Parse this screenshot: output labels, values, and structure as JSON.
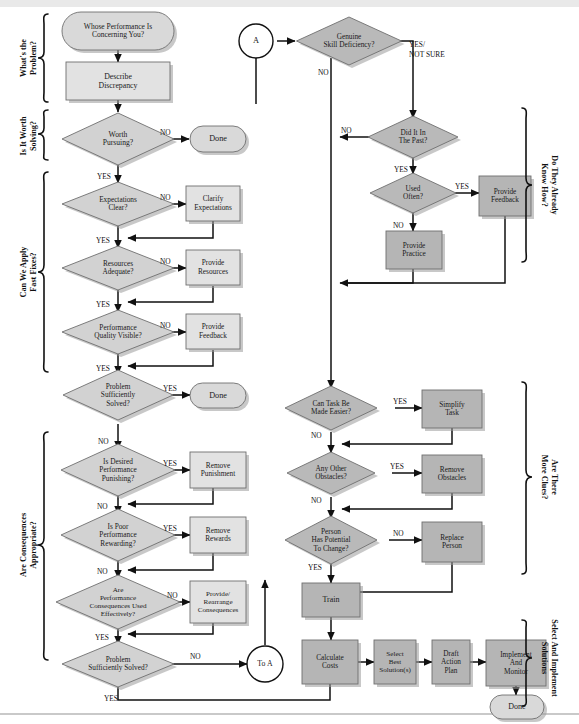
{
  "diagram": {
    "colors": {
      "light_box": "#e2e2e2",
      "dark_box": "#b5b5b5",
      "diamond": "#d2d2d2",
      "diamond_dark": "#b9b9b9",
      "terminator": "#d9d9d9",
      "line": "#111111",
      "text": "#1a1a1a"
    },
    "group_labels": {
      "left": [
        "What's the Problem?",
        "Is It Worth Solving?",
        "Can We Apply Fast Fixes?",
        "Are Consequences Appropriate?"
      ],
      "right": [
        "Do They Already Know How?",
        "Are There More Clues?",
        "Select And Implement Solutions"
      ]
    },
    "edge_labels": {
      "yes": "YES",
      "no": "NO",
      "yes_not_sure": "YES/ NOT SURE"
    },
    "nodes": {
      "whose_performance": "Whose Performance Is Concerning You?",
      "describe_discrepancy": "Describe Discrepancy",
      "worth_pursuing": "Worth Pursuing?",
      "done_1": "Done",
      "expectations_clear": "Expectations Clear?",
      "clarify_expectations": "Clarify Expectations",
      "resources_adequate": "Resources Adequate?",
      "provide_resources": "Provide Resources",
      "performance_quality_visible": "Performance Quality Visible?",
      "provide_feedback_left": "Provide Feedback",
      "problem_solved_1": "Problem Sufficiently Solved?",
      "done_2": "Done",
      "is_desired_performance_punishing": "Is Desired Performance Punishing?",
      "remove_punishment": "Remove Punishment",
      "is_poor_performance_rewarding": "Is Poor Performance Rewarding?",
      "remove_rewards": "Remove Rewards",
      "are_performance_consequences": "Are Performance Consequences Used Effectively?",
      "provide_rearrange_consequences": "Provide/ Rearrange Consequences",
      "problem_solved_2": "Problem Sufficiently Solved?",
      "to_a": "To A",
      "connector_a": "A",
      "genuine_skill_deficiency": "Genuine Skill Deficiency?",
      "did_it_in_the_past": "Did It In The Past?",
      "used_often": "Used Often?",
      "provide_feedback_right": "Provide Feedback",
      "provide_practice": "Provide Practice",
      "can_task_be_made_easier": "Can Task Be Made Easier?",
      "simplify_task": "Simplify Task",
      "any_other_obstacles": "Any Other Obstacles?",
      "remove_obstacles": "Remove Obstacles",
      "person_has_potential": "Person Has Potential To Change?",
      "replace_person": "Replace Person",
      "train": "Train",
      "calculate_costs": "Calculate Costs",
      "select_best_solutions": "Select Best Solution(s)",
      "draft_action_plan": "Draft Action Plan",
      "implement_and_monitor": "Implement And Monitor",
      "done_3": "Done"
    },
    "node_lines": {
      "whose_performance": [
        "Whose Performance Is",
        "Concerning You?"
      ],
      "describe_discrepancy": [
        "Describe",
        "Discrepancy"
      ],
      "worth_pursuing": [
        "Worth",
        "Pursuing?"
      ],
      "done_1": [
        "Done"
      ],
      "expectations_clear": [
        "Expectations",
        "Clear?"
      ],
      "clarify_expectations": [
        "Clarify",
        "Expectations"
      ],
      "resources_adequate": [
        "Resources",
        "Adequate?"
      ],
      "provide_resources": [
        "Provide",
        "Resources"
      ],
      "performance_quality_visible": [
        "Performance",
        "Quality Visible?"
      ],
      "provide_feedback_left": [
        "Provide",
        "Feedback"
      ],
      "problem_solved_1": [
        "Problem",
        "Sufficiently",
        "Solved?"
      ],
      "done_2": [
        "Done"
      ],
      "is_desired_performance_punishing": [
        "Is Desired",
        "Performance",
        "Punishing?"
      ],
      "remove_punishment": [
        "Remove",
        "Punishment"
      ],
      "is_poor_performance_rewarding": [
        "Is Poor",
        "Performance",
        "Rewarding?"
      ],
      "remove_rewards": [
        "Remove",
        "Rewards"
      ],
      "are_performance_consequences": [
        "Are",
        "Performance",
        "Consequences Used",
        "Effectively?"
      ],
      "provide_rearrange_consequences": [
        "Provide/",
        "Rearrange",
        "Consequences"
      ],
      "problem_solved_2": [
        "Problem",
        "Sufficiently Solved?"
      ],
      "to_a": [
        "To A"
      ],
      "connector_a": [
        "A"
      ],
      "genuine_skill_deficiency": [
        "Genuine",
        "Skill Deficiency?"
      ],
      "did_it_in_the_past": [
        "Did It In",
        "The Past?"
      ],
      "used_often": [
        "Used",
        "Often?"
      ],
      "provide_feedback_right": [
        "Provide",
        "Feedback"
      ],
      "provide_practice": [
        "Provide",
        "Practice"
      ],
      "can_task_be_made_easier": [
        "Can Task Be",
        "Made Easier?"
      ],
      "simplify_task": [
        "Simplify",
        "Task"
      ],
      "any_other_obstacles": [
        "Any Other",
        "Obstacles?"
      ],
      "remove_obstacles": [
        "Remove",
        "Obstacles"
      ],
      "person_has_potential": [
        "Person",
        "Has Potential",
        "To Change?"
      ],
      "replace_person": [
        "Replace",
        "Person"
      ],
      "train": [
        "Train"
      ],
      "calculate_costs": [
        "Calculate",
        "Costs"
      ],
      "select_best_solutions": [
        "Select",
        "Best",
        "Solution(s)"
      ],
      "draft_action_plan": [
        "Draft",
        "Action",
        "Plan"
      ],
      "implement_and_monitor": [
        "Implement",
        "And",
        "Monitor"
      ],
      "done_3": [
        "Done"
      ]
    }
  }
}
